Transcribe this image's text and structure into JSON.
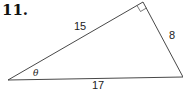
{
  "problem": {
    "number": "11.",
    "triangle": {
      "vertices": {
        "left": [
          8,
          80
        ],
        "right_angle": [
          143,
          2
        ],
        "right": [
          183,
          77
        ]
      },
      "sides": {
        "hypotenuse": "17",
        "adjacent": "15",
        "opposite": "8"
      },
      "angle_label": "θ",
      "right_angle_marker": true
    }
  }
}
